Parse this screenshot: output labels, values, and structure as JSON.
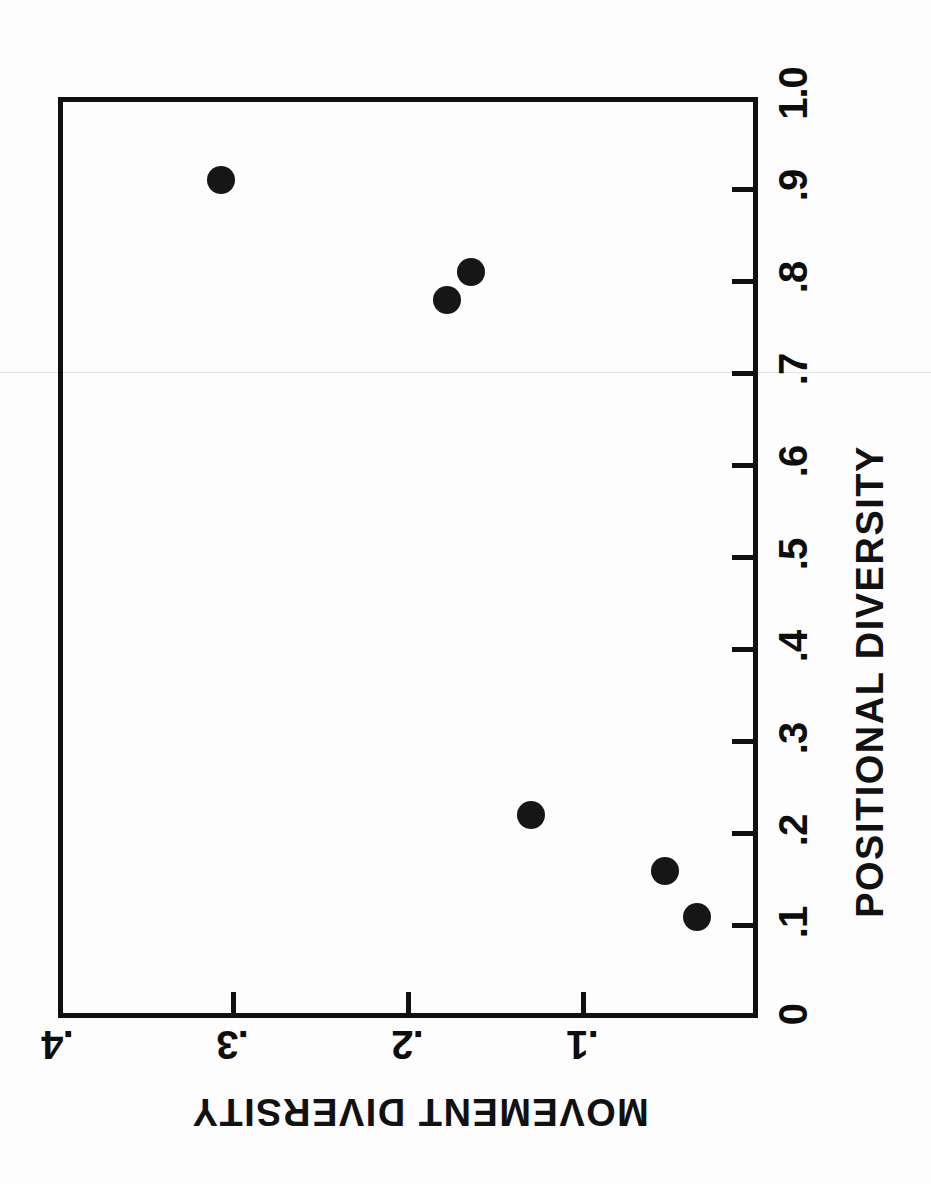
{
  "chart_data": {
    "type": "scatter",
    "title": "",
    "xlabel": "POSITIONAL DIVERSITY",
    "ylabel": "MOVEMENT DIVERSITY",
    "xlim": [
      0,
      1.0
    ],
    "ylim": [
      0,
      0.4
    ],
    "grid": false,
    "legend": null,
    "orientation": "rotated-90",
    "xticks": [
      {
        "value": 0,
        "label": "0"
      },
      {
        "value": 0.1,
        "label": ".1"
      },
      {
        "value": 0.2,
        "label": ".2"
      },
      {
        "value": 0.3,
        "label": ".3"
      },
      {
        "value": 0.4,
        "label": ".4"
      },
      {
        "value": 0.5,
        "label": ".5"
      },
      {
        "value": 0.6,
        "label": ".6"
      },
      {
        "value": 0.7,
        "label": ".7"
      },
      {
        "value": 0.8,
        "label": ".8"
      },
      {
        "value": 0.9,
        "label": ".9"
      },
      {
        "value": 1.0,
        "label": "1.0"
      }
    ],
    "yticks": [
      {
        "value": 0.1,
        "label": ".1"
      },
      {
        "value": 0.2,
        "label": ".2"
      },
      {
        "value": 0.3,
        "label": ".3"
      },
      {
        "value": 0.4,
        "label": ".4"
      }
    ],
    "points": [
      {
        "x": 0.91,
        "y": 0.307
      },
      {
        "x": 0.81,
        "y": 0.164
      },
      {
        "x": 0.78,
        "y": 0.178
      },
      {
        "x": 0.22,
        "y": 0.13
      },
      {
        "x": 0.16,
        "y": 0.053
      },
      {
        "x": 0.11,
        "y": 0.035
      }
    ],
    "marker": {
      "shape": "circle",
      "color": "#161616",
      "size_px": 28
    }
  },
  "figure": {
    "axis_color": "#111111",
    "background": "#fdfdfd",
    "frame": {
      "left": 58,
      "top": 97,
      "width": 700,
      "height": 921
    }
  }
}
